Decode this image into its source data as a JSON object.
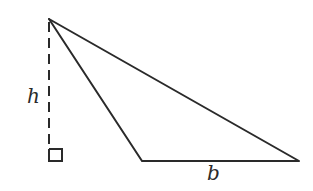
{
  "diagram": {
    "type": "triangle-area",
    "stroke_color": "#2a2a2a",
    "background": "#ffffff",
    "vertices": {
      "apex": [
        49,
        19
      ],
      "base_left": [
        142,
        161
      ],
      "base_right": [
        299,
        161
      ]
    },
    "height_foot": [
      49,
      161
    ],
    "right_angle_marker": {
      "x": 49,
      "y": 149,
      "size": 12
    },
    "labels": {
      "height": "h",
      "base": "b"
    }
  }
}
